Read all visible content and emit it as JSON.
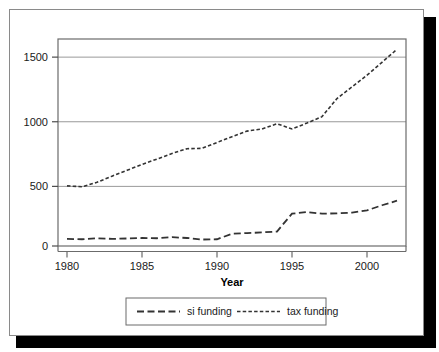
{
  "figure": {
    "background_color": "#ffffff",
    "frame_color": "#8a8a8a",
    "shadow_color": "#000000"
  },
  "chart_data": {
    "type": "line",
    "title": "",
    "xlabel": "Year",
    "ylabel": "",
    "xlim": [
      1979.4,
      2002.6
    ],
    "ylim": [
      0,
      1600
    ],
    "xticks": [
      1980,
      1985,
      1990,
      1995,
      2000
    ],
    "yticks": [
      0,
      500,
      1000,
      1500
    ],
    "xtick_labels": [
      "1980",
      "1985",
      "1990",
      "1995",
      "2000"
    ],
    "ytick_labels": [
      "0",
      "500",
      "1000",
      "1500"
    ],
    "grid": "horizontal",
    "grid_color": "#999999",
    "legend_position": "below-axes",
    "line_color": "#333333",
    "x": [
      1980,
      1981,
      1982,
      1983,
      1984,
      1985,
      1986,
      1987,
      1988,
      1989,
      1990,
      1991,
      1992,
      1993,
      1994,
      1995,
      1996,
      1997,
      1998,
      1999,
      2000,
      2001,
      2002
    ],
    "series": [
      {
        "name": "si funding",
        "dash": "long-dash",
        "values": [
          55,
          52,
          60,
          55,
          58,
          62,
          60,
          68,
          62,
          50,
          52,
          95,
          100,
          105,
          112,
          250,
          262,
          250,
          252,
          258,
          275,
          315,
          350
        ]
      },
      {
        "name": "tax funding",
        "dash": "short-dash",
        "values": [
          465,
          458,
          492,
          540,
          585,
          630,
          672,
          715,
          752,
          755,
          800,
          845,
          888,
          905,
          945,
          905,
          950,
          1000,
          1140,
          1230,
          1320,
          1420,
          1520
        ]
      }
    ]
  },
  "legend": {
    "entries": [
      {
        "label": "si funding"
      },
      {
        "label": "tax funding"
      }
    ]
  }
}
